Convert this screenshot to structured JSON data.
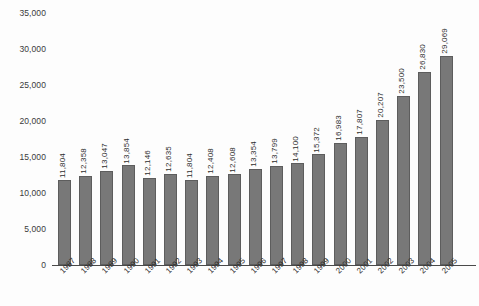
{
  "chart_data": {
    "type": "bar",
    "title": "",
    "subtitle": "",
    "xlabel": "",
    "ylabel": "",
    "ylim": [
      0,
      35000
    ],
    "grid": false,
    "legend": null,
    "y_ticks": [
      "0",
      "5,000",
      "10,000",
      "15,000",
      "20,000",
      "25,000",
      "30,000",
      "35,000"
    ],
    "y_tick_values": [
      0,
      5000,
      10000,
      15000,
      20000,
      25000,
      30000,
      35000
    ],
    "categories": [
      "1987",
      "1988",
      "1989",
      "1990",
      "1991",
      "1992",
      "1993",
      "1994",
      "1995",
      "1996",
      "1997",
      "1998",
      "1999",
      "2000",
      "2001",
      "2002",
      "2003",
      "2004",
      "2005"
    ],
    "values": [
      11804,
      12358,
      13047,
      13854,
      12146,
      12635,
      11804,
      12408,
      12608,
      13354,
      13799,
      14100,
      15372,
      16983,
      17807,
      20207,
      23500,
      26830,
      29069
    ],
    "data_labels": [
      "11,804",
      "12,358",
      "13,047",
      "13,854",
      "12,146",
      "12,635",
      "11,804",
      "12,408",
      "12,608",
      "13,354",
      "13,799",
      "14,100",
      "15,372",
      "16,983",
      "17,807",
      "20,207",
      "23,500",
      "26,830",
      "29,069"
    ],
    "bar_color": "#787878",
    "bar_border_color": "#5d5d5d",
    "axis_color": "#4a4a4a",
    "background_color": "#fdfdfd"
  }
}
